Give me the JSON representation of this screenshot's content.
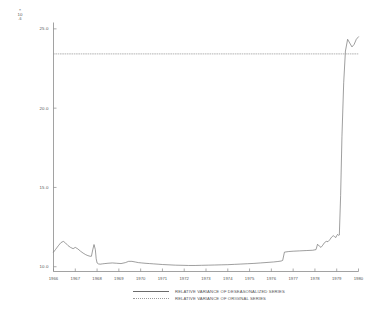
{
  "chart_data": {
    "type": "line",
    "title": "",
    "xlabel": "",
    "ylabel": "",
    "y_unit_label": {
      "times": "×",
      "base": "10",
      "exp": "-6"
    },
    "grid": false,
    "legend_position": "bottom-center",
    "xlim": [
      1966.0,
      1980.0
    ],
    "ylim": [
      9.7,
      25.4
    ],
    "xticks": [
      "1966",
      "1967",
      "1968",
      "1969",
      "1970",
      "1971",
      "1972",
      "1973",
      "1974",
      "1975",
      "1976",
      "1977",
      "1978",
      "1979",
      "1980"
    ],
    "yticks": [
      "25.0",
      "20.0",
      "15.0",
      "10.0"
    ],
    "ytick_values": [
      25.0,
      20.0,
      15.0,
      10.0
    ],
    "series": [
      {
        "name": "RELATIVE VARIANCE OF DESEASONALIZED SERIES",
        "style": "solid",
        "color": "#6b6b6b",
        "x": [
          1966.0,
          1966.1,
          1966.22,
          1966.34,
          1966.45,
          1966.55,
          1966.66,
          1966.78,
          1966.9,
          1967.0,
          1967.12,
          1967.24,
          1967.36,
          1967.48,
          1967.58,
          1967.68,
          1967.74,
          1967.8,
          1967.86,
          1967.92,
          1967.96,
          1968.0,
          1968.06,
          1968.14,
          1968.24,
          1968.36,
          1968.5,
          1968.7,
          1968.9,
          1969.1,
          1969.3,
          1969.45,
          1969.6,
          1969.75,
          1969.9,
          1970.05,
          1970.2,
          1970.4,
          1970.6,
          1970.8,
          1971.0,
          1971.3,
          1971.6,
          1971.9,
          1972.2,
          1972.5,
          1972.8,
          1973.1,
          1973.4,
          1973.7,
          1974.0,
          1974.3,
          1974.6,
          1974.9,
          1975.2,
          1975.5,
          1975.8,
          1976.1,
          1976.3,
          1976.45,
          1976.52,
          1976.6,
          1976.8,
          1977.0,
          1977.3,
          1977.6,
          1977.9,
          1978.05,
          1978.12,
          1978.2,
          1978.28,
          1978.36,
          1978.44,
          1978.52,
          1978.6,
          1978.68,
          1978.76,
          1978.84,
          1978.9,
          1978.96,
          1979.0,
          1979.04,
          1979.08,
          1979.12,
          1979.18,
          1979.24,
          1979.32,
          1979.4,
          1979.5,
          1979.6,
          1979.7,
          1979.8,
          1979.9,
          1980.0
        ],
        "y": [
          10.92,
          11.1,
          11.32,
          11.52,
          11.6,
          11.5,
          11.34,
          11.22,
          11.14,
          11.22,
          11.12,
          10.98,
          10.86,
          10.76,
          10.7,
          10.66,
          10.66,
          11.06,
          11.4,
          11.08,
          10.5,
          10.24,
          10.18,
          10.16,
          10.18,
          10.2,
          10.22,
          10.24,
          10.22,
          10.2,
          10.26,
          10.34,
          10.34,
          10.3,
          10.26,
          10.24,
          10.22,
          10.2,
          10.18,
          10.16,
          10.14,
          10.12,
          10.1,
          10.09,
          10.08,
          10.08,
          10.09,
          10.1,
          10.11,
          10.12,
          10.13,
          10.15,
          10.17,
          10.19,
          10.21,
          10.24,
          10.27,
          10.3,
          10.33,
          10.36,
          10.4,
          10.92,
          10.96,
          10.98,
          11.0,
          11.02,
          11.04,
          11.08,
          11.42,
          11.3,
          11.22,
          11.36,
          11.52,
          11.6,
          11.58,
          11.7,
          11.86,
          11.96,
          11.9,
          11.84,
          11.96,
          12.04,
          11.98,
          12.0,
          14.5,
          18.2,
          21.6,
          23.6,
          24.34,
          24.1,
          23.86,
          24.02,
          24.34,
          24.5
        ]
      },
      {
        "name": "RELATIVE VARIANCE OF ORIGINAL SERIES",
        "style": "dotted",
        "color": "#9a9a9a",
        "constant_value": 23.42,
        "x": [
          1966.0,
          1980.0
        ],
        "y": [
          23.42,
          23.42
        ]
      }
    ],
    "axes": {
      "left": true,
      "bottom": true,
      "top": false,
      "right": false,
      "color": "#8a8a8a"
    }
  },
  "legend": {
    "entries": [
      {
        "label": "RELATIVE VARIANCE OF DESEASONALIZED SERIES",
        "style": "solid"
      },
      {
        "label": "RELATIVE VARIANCE OF ORIGINAL SERIES",
        "style": "dotted"
      }
    ]
  }
}
